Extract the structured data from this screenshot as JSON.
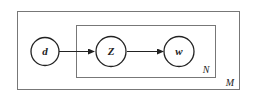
{
  "diagram": {
    "type": "plate-notation",
    "nodes": [
      {
        "id": "d",
        "label": "d"
      },
      {
        "id": "Z",
        "label": "Z"
      },
      {
        "id": "w",
        "label": "w"
      }
    ],
    "edges": [
      {
        "from": "d",
        "to": "Z"
      },
      {
        "from": "Z",
        "to": "w"
      }
    ],
    "plates": [
      {
        "id": "outer",
        "label": "M",
        "contains": [
          "d",
          "Z",
          "w"
        ]
      },
      {
        "id": "inner",
        "label": "N",
        "contains": [
          "Z",
          "w"
        ]
      }
    ]
  },
  "colors": {
    "stroke": "#222222",
    "plate": "#777777",
    "background": "#ffffff"
  }
}
